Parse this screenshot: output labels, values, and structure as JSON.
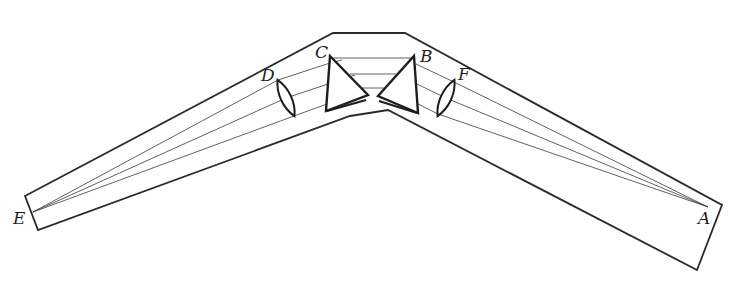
{
  "figure": {
    "labels": {
      "E": "E",
      "D": "D",
      "C": "C",
      "B": "B",
      "F": "F",
      "A": "A"
    },
    "components": [
      {
        "id": "E",
        "kind": "focal-point"
      },
      {
        "id": "D",
        "kind": "lens"
      },
      {
        "id": "C",
        "kind": "prism"
      },
      {
        "id": "B",
        "kind": "prism"
      },
      {
        "id": "F",
        "kind": "lens"
      },
      {
        "id": "A",
        "kind": "focal-point"
      }
    ],
    "colors": {
      "line": "#1e1e1e",
      "background": "#ffffff"
    }
  }
}
